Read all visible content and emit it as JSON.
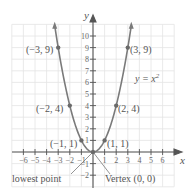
{
  "chart_data": {
    "type": "line",
    "title": "",
    "xlabel": "x",
    "ylabel": "y",
    "xlim": [
      -7,
      7
    ],
    "ylim": [
      -3,
      11
    ],
    "grid": true,
    "x_ticks": [
      -6,
      -5,
      -4,
      -3,
      -2,
      -1,
      1,
      2,
      3,
      4,
      5,
      6
    ],
    "y_ticks": [
      -2,
      -1,
      1,
      2,
      3,
      4,
      5,
      6,
      7,
      8,
      9,
      10
    ],
    "x_tick_labels": [
      "−6",
      "−5",
      "−4",
      "−3",
      "−2",
      "−1",
      "1",
      "2",
      "3",
      "4",
      "5",
      "6"
    ],
    "y_tick_labels": [
      "−2",
      "−1",
      "1",
      "2",
      "3",
      "4",
      "5",
      "6",
      "7",
      "8",
      "9",
      "10"
    ],
    "series": [
      {
        "name": "y = x^2",
        "equation_label": "y = x²",
        "x": [
          -3.3,
          -3,
          -2,
          -1,
          0,
          1,
          2,
          3,
          3.3
        ],
        "y": [
          10.89,
          9,
          4,
          1,
          0,
          1,
          4,
          9,
          10.89
        ]
      }
    ],
    "points": [
      {
        "x": -3,
        "y": 9,
        "label": "(−3, 9)"
      },
      {
        "x": 3,
        "y": 9,
        "label": "(3, 9)"
      },
      {
        "x": -2,
        "y": 4,
        "label": "(−2, 4)"
      },
      {
        "x": 2,
        "y": 4,
        "label": "(2, 4)"
      },
      {
        "x": -1,
        "y": 1,
        "label": "(−1, 1)"
      },
      {
        "x": 1,
        "y": 1,
        "label": "(1, 1)"
      },
      {
        "x": 0,
        "y": 0,
        "label": "Vertex (0, 0)"
      }
    ],
    "annotations": [
      {
        "text": "lowest point",
        "points_to": [
          0,
          0
        ]
      },
      {
        "text": "Vertex (0, 0)",
        "points_to": [
          0,
          0
        ]
      }
    ]
  },
  "labels": {
    "equation": "y = x",
    "equation_exp": "2",
    "x_axis": "x",
    "y_axis": "y",
    "lowest_point": "lowest point",
    "vertex": "Vertex (0, 0)",
    "p_m3_9": "(−3, 9)",
    "p_3_9": "(3, 9)",
    "p_m2_4": "(−2, 4)",
    "p_2_4": "(2, 4)",
    "p_m1_1": "(−1, 1)",
    "p_1_1": "(1, 1)"
  },
  "colors": {
    "curve": "#7a7a7a",
    "grid": "#e6e6e6",
    "axis": "#555555",
    "text": "#555555"
  }
}
